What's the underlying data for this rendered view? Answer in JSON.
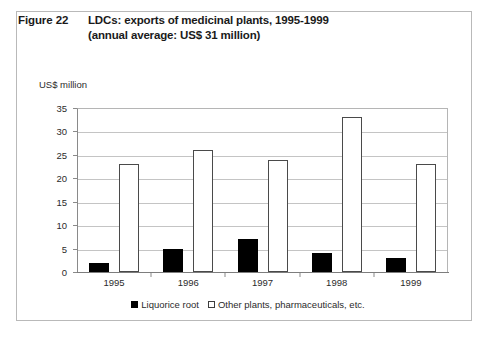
{
  "figure": {
    "number": "Figure 22",
    "title_line_1": "LDCs: exports of medicinal plants, 1995-1999",
    "title_line_2": "(annual average: US$ 31 million)"
  },
  "chart_data": {
    "type": "bar",
    "title": "LDCs: exports of medicinal plants, 1995-1999 (annual average: US$ 31 million)",
    "xlabel": "",
    "ylabel": "US$ million",
    "categories": [
      "1995",
      "1996",
      "1997",
      "1998",
      "1999"
    ],
    "series": [
      {
        "name": "Liquorice root",
        "color": "#000000",
        "style": "filled",
        "values": [
          2,
          5,
          7,
          4,
          3
        ]
      },
      {
        "name": "Other plants, pharmaceuticals, etc.",
        "color": "#ffffff",
        "style": "hollow",
        "values": [
          23,
          26,
          24,
          33,
          23
        ]
      }
    ],
    "ylim": [
      0,
      35
    ],
    "yticks": [
      0,
      5,
      10,
      15,
      20,
      25,
      30,
      35
    ],
    "ytick_labels": [
      "0",
      "5",
      "10",
      "15",
      "20",
      "25",
      "30",
      "35"
    ],
    "grid": "horizontal",
    "legend_position": "bottom-center"
  }
}
